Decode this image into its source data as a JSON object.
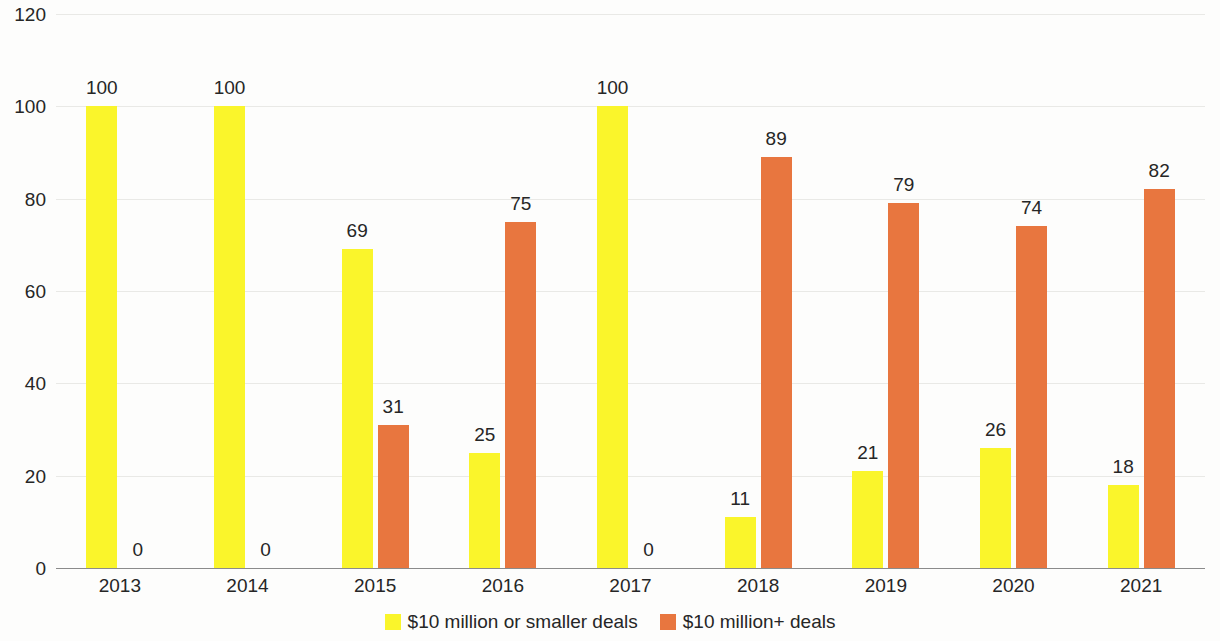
{
  "chart_data": {
    "type": "bar",
    "title": "",
    "subtitle": "",
    "xlabel": "",
    "ylabel": "",
    "ylim": [
      0,
      120
    ],
    "ytick_labels": [
      "0",
      "20",
      "40",
      "60",
      "80",
      "100",
      "120"
    ],
    "yticks": [
      0,
      20,
      40,
      60,
      80,
      100,
      120
    ],
    "grid": true,
    "legend_position": "bottom",
    "categories": [
      "2013",
      "2014",
      "2015",
      "2016",
      "2017",
      "2018",
      "2019",
      "2020",
      "2021"
    ],
    "series": [
      {
        "name": "$10 million or smaller deals",
        "color": "#faf52b",
        "values": [
          100,
          100,
          69,
          25,
          100,
          11,
          21,
          26,
          18
        ],
        "labels": [
          "100",
          "100",
          "69",
          "25",
          "100",
          "11",
          "21",
          "26",
          "18"
        ]
      },
      {
        "name": "$10 million+ deals",
        "color": "#e8763f",
        "values": [
          0,
          0,
          31,
          75,
          0,
          89,
          79,
          74,
          82
        ],
        "labels": [
          "0",
          "0",
          "31",
          "75",
          "0",
          "89",
          "79",
          "74",
          "82"
        ]
      }
    ]
  },
  "axis": {
    "y_ticks": [
      "120",
      "100",
      "80",
      "60",
      "40",
      "20",
      "0"
    ],
    "x_ticks": [
      "2013",
      "2014",
      "2015",
      "2016",
      "2017",
      "2018",
      "2019",
      "2020",
      "2021"
    ]
  },
  "legend": {
    "items": [
      {
        "label": "$10 million or smaller deals",
        "color": "#faf52b"
      },
      {
        "label": "$10 million+ deals",
        "color": "#e8763f"
      }
    ]
  },
  "colors": {
    "series_small": "#faf52b",
    "series_large": "#e8763f",
    "gridline": "#e9e9e6",
    "axis": "#8b8b8b",
    "text": "#262626",
    "background": "#fdfdfc"
  }
}
